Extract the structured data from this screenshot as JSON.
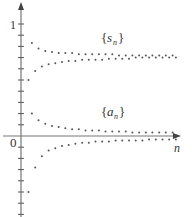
{
  "chart_data": {
    "type": "scatter",
    "title": "",
    "xlabel": "n",
    "ylabel": "",
    "ylim": [
      -0.72,
      1.18
    ],
    "y_ticks_step": 0.1,
    "y_tick_labels": [
      {
        "value": 1,
        "label": "1"
      },
      {
        "value": 0,
        "label": "0"
      }
    ],
    "grid": false,
    "legend": "inline labels",
    "annotations": [
      {
        "text": "{s_n}",
        "x_px": 110,
        "y_px": 37
      },
      {
        "text": "{a_n}",
        "x_px": 110,
        "y_px": 110
      }
    ],
    "series": [
      {
        "name": "{s_n}",
        "description": "partial sums oscillating and converging to about 0.72",
        "x": [
          1,
          2,
          3,
          4,
          5,
          6,
          7,
          8,
          9,
          10,
          11,
          12,
          13,
          14,
          15,
          16,
          17,
          18,
          19,
          20,
          21,
          22,
          23,
          24,
          25,
          26,
          27,
          28,
          29,
          30,
          31,
          32,
          33,
          34,
          35,
          36,
          37,
          38,
          39,
          40,
          41,
          42,
          43,
          44,
          45,
          46
        ],
        "values": [
          0.5,
          0.83,
          0.58,
          0.78,
          0.62,
          0.76,
          0.64,
          0.75,
          0.65,
          0.74,
          0.66,
          0.74,
          0.67,
          0.74,
          0.67,
          0.73,
          0.68,
          0.73,
          0.68,
          0.73,
          0.68,
          0.73,
          0.68,
          0.73,
          0.69,
          0.73,
          0.69,
          0.72,
          0.69,
          0.72,
          0.69,
          0.72,
          0.7,
          0.72,
          0.7,
          0.72,
          0.7,
          0.72,
          0.7,
          0.72,
          0.7,
          0.72,
          0.7,
          0.72,
          0.7,
          0.71
        ]
      },
      {
        "name": "{a_n}",
        "description": "terms (-1)^(n+1)/n style, alternating and converging to 0",
        "x": [
          1,
          2,
          3,
          4,
          5,
          6,
          7,
          8,
          9,
          10,
          11,
          12,
          13,
          14,
          15,
          16,
          17,
          18,
          19,
          20,
          21,
          22,
          23,
          24,
          25,
          26,
          27,
          28,
          29,
          30,
          31,
          32,
          33,
          34,
          35,
          36,
          37,
          38,
          39,
          40,
          41,
          42,
          43,
          44,
          45,
          46
        ],
        "values": [
          -0.5,
          0.2,
          -0.28,
          0.14,
          -0.18,
          0.11,
          -0.13,
          0.09,
          -0.11,
          0.08,
          -0.09,
          0.07,
          -0.08,
          0.06,
          -0.07,
          0.06,
          -0.06,
          0.05,
          -0.06,
          0.05,
          -0.05,
          0.05,
          -0.05,
          0.04,
          -0.05,
          0.04,
          -0.04,
          0.04,
          -0.04,
          0.04,
          -0.04,
          0.03,
          -0.04,
          0.03,
          -0.04,
          0.03,
          -0.03,
          0.03,
          -0.03,
          0.03,
          -0.03,
          0.03,
          -0.03,
          0.03,
          -0.03,
          0.03
        ]
      }
    ]
  },
  "labels": {
    "y_one": "1",
    "origin": "0",
    "x_axis": "n",
    "s_brace_open": "{",
    "s_main": "s",
    "s_sub": "n",
    "s_brace_close": "}",
    "a_brace_open": "{",
    "a_main": "a",
    "a_sub": "n",
    "a_brace_close": "}"
  }
}
